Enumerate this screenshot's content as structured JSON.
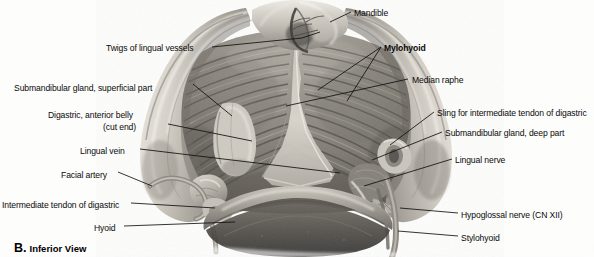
{
  "figure": {
    "caption_letter": "B.",
    "caption_text": "Inferior View",
    "view": "Inferior View",
    "background_color": "#fdfdfc",
    "line_color": "#101010",
    "text_color": "#0a0a0a"
  },
  "labels": {
    "left": [
      {
        "id": "twigs-of-lingual-vessels",
        "text": "Twigs of lingual vessels",
        "x": 106,
        "y": 43,
        "align": "right",
        "bold": false
      },
      {
        "id": "submandibular-gland-superficial-part",
        "text": "Submandibular gland, superficial part",
        "x": 14,
        "y": 83,
        "align": "left",
        "bold": false
      },
      {
        "id": "digastric-anterior-belly",
        "text": "Digastric, anterior belly",
        "x": 48,
        "y": 110,
        "align": "left",
        "bold": false
      },
      {
        "id": "digastric-cut-end",
        "text": "(cut end)",
        "x": 103,
        "y": 122,
        "align": "left",
        "bold": false
      },
      {
        "id": "lingual-vein",
        "text": "Lingual vein",
        "x": 80,
        "y": 146,
        "align": "left",
        "bold": false
      },
      {
        "id": "facial-artery",
        "text": "Facial artery",
        "x": 61,
        "y": 170,
        "align": "left",
        "bold": false
      },
      {
        "id": "intermediate-tendon-of-digastric",
        "text": "Intermediate tendon of digastric",
        "x": 2,
        "y": 200,
        "align": "left",
        "bold": false
      },
      {
        "id": "hyoid",
        "text": "Hyoid",
        "x": 94,
        "y": 223,
        "align": "left",
        "bold": false
      }
    ],
    "right": [
      {
        "id": "mandible",
        "text": "Mandible",
        "x": 354,
        "y": 8,
        "align": "left",
        "bold": false
      },
      {
        "id": "mylohyoid",
        "text": "Mylohyoid",
        "x": 384,
        "y": 43,
        "align": "left",
        "bold": true
      },
      {
        "id": "median-raphe",
        "text": "Median raphe",
        "x": 412,
        "y": 75,
        "align": "left",
        "bold": false
      },
      {
        "id": "sling-for-intermediate-tendon-of-digastric",
        "text": "Sling for intermediate tendon of digastric",
        "x": 437,
        "y": 108,
        "align": "left",
        "bold": false
      },
      {
        "id": "submandibular-gland-deep-part",
        "text": "Submandibular gland, deep part",
        "x": 445,
        "y": 128,
        "align": "left",
        "bold": false
      },
      {
        "id": "lingual-nerve",
        "text": "Lingual nerve",
        "x": 455,
        "y": 155,
        "align": "left",
        "bold": false
      },
      {
        "id": "hypoglossal-nerve",
        "text": "Hypoglossal nerve (CN XII)",
        "x": 461,
        "y": 210,
        "align": "left",
        "bold": false
      },
      {
        "id": "stylohyoid",
        "text": "Stylohyoid",
        "x": 461,
        "y": 233,
        "align": "left",
        "bold": false
      }
    ]
  },
  "leader_lines": [
    {
      "id": "leader-twigs-of-lingual-vessels",
      "points": "212,47 302,38 320,32"
    },
    {
      "id": "leader-submandibular-gland-superficial-part",
      "points": "193,84 232,116"
    },
    {
      "id": "leader-digastric-anterior-belly",
      "points": "168,124 252,141"
    },
    {
      "id": "leader-lingual-vein",
      "points": "140,149 340,173"
    },
    {
      "id": "leader-facial-artery",
      "points": "118,172 152,186"
    },
    {
      "id": "leader-intermediate-tendon-of-digastric",
      "points": "131,203 215,208"
    },
    {
      "id": "leader-hyoid",
      "points": "124,226 235,222"
    },
    {
      "id": "leader-mandible",
      "points": "351,12 330,22"
    },
    {
      "id": "leader-mylohyoid-a",
      "points": "381,47 318,90"
    },
    {
      "id": "leader-mylohyoid-b",
      "points": "381,47 347,101"
    },
    {
      "id": "leader-median-raphe",
      "points": "408,79 286,106"
    },
    {
      "id": "leader-sling",
      "points": "434,112 390,145"
    },
    {
      "id": "leader-submandibular-gland-deep-part",
      "points": "442,132 372,160"
    },
    {
      "id": "leader-lingual-nerve",
      "points": "452,159 364,186"
    },
    {
      "id": "leader-hypoglossal-nerve",
      "points": "458,213 400,208"
    },
    {
      "id": "leader-stylohyoid",
      "points": "458,236 398,231"
    }
  ],
  "anatomy_regions": [
    {
      "id": "mandible-left-ramus",
      "name": "Mandible, left body"
    },
    {
      "id": "mandible-right-ramus",
      "name": "Mandible, right body"
    },
    {
      "id": "mandible-symphysis",
      "name": "Mandible, symphysis"
    },
    {
      "id": "mylohyoid-sheet",
      "name": "Mylohyoid muscle"
    },
    {
      "id": "median-raphe-band",
      "name": "Median raphe"
    },
    {
      "id": "digastric-anterior-belly-stump",
      "name": "Digastric anterior belly, cut end"
    },
    {
      "id": "hyoid-bone",
      "name": "Hyoid bone"
    },
    {
      "id": "submandibular-gland-superficial",
      "name": "Submandibular gland, superficial part"
    },
    {
      "id": "submandibular-gland-deep",
      "name": "Submandibular gland, deep part"
    },
    {
      "id": "digastric-sling",
      "name": "Sling for intermediate tendon of digastric"
    },
    {
      "id": "stylohyoid-muscle",
      "name": "Stylohyoid muscle"
    },
    {
      "id": "hypoglossal-nerve-strand",
      "name": "Hypoglossal nerve (CN XII)"
    },
    {
      "id": "lingual-nerve-strand",
      "name": "Lingual nerve"
    },
    {
      "id": "facial-artery-vessel",
      "name": "Facial artery"
    },
    {
      "id": "lingual-vein-vessel",
      "name": "Lingual vein"
    }
  ]
}
